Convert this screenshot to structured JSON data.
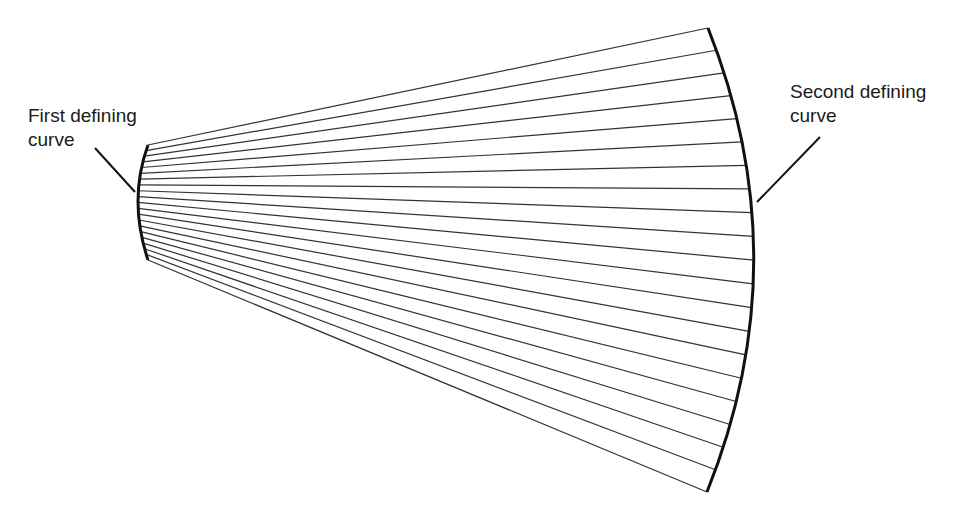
{
  "diagram": {
    "labels": {
      "first_curve": [
        "First defining",
        "curve"
      ],
      "second_curve": [
        "Second defining",
        "curve"
      ]
    },
    "ruling_count": 21,
    "colors": {
      "curve": "#111111",
      "ruling": "#333333",
      "text": "#1a1a1a",
      "background": "#ffffff"
    }
  }
}
